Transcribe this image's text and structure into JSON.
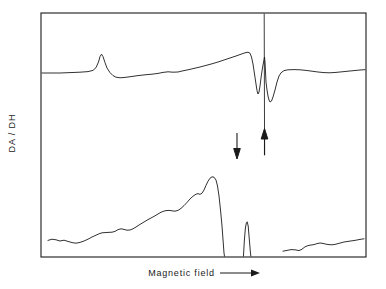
{
  "figure": {
    "type": "scientific-spectrum-figure",
    "background_color": "#ffffff",
    "line_color": "#1a1a1a",
    "frame": {
      "x": 41,
      "y": 13,
      "width": 325,
      "height": 244,
      "stroke_width": 1.1
    }
  },
  "labels": {
    "y_axis": "DA / DH",
    "x_axis": "Magnetic field",
    "x_axis_arrow_icon": "right-arrow-icon"
  },
  "chart_data": {
    "type": "line",
    "title": "",
    "xlabel": "Magnetic field",
    "ylabel": "DA / DH",
    "xlim": [
      41,
      366
    ],
    "ylim": [
      13,
      257
    ],
    "grid": false,
    "legend": null,
    "axis_ticks": "none",
    "series": [
      {
        "name": "upper-trace",
        "baseline_y": 73,
        "points": [
          [
            41,
            73
          ],
          [
            50,
            73
          ],
          [
            60,
            73
          ],
          [
            70,
            72.6
          ],
          [
            80,
            72.2
          ],
          [
            88,
            71.6
          ],
          [
            93,
            70.4
          ],
          [
            96,
            67.6
          ],
          [
            98.5,
            62.0
          ],
          [
            100,
            56.6
          ],
          [
            101.5,
            54.2
          ],
          [
            103,
            56.6
          ],
          [
            105,
            62.6
          ],
          [
            107,
            68.0
          ],
          [
            110,
            72.6
          ],
          [
            113,
            75.6
          ],
          [
            116,
            77.2
          ],
          [
            120,
            77.8
          ],
          [
            125,
            77.4
          ],
          [
            131,
            76.6
          ],
          [
            138,
            75.6
          ],
          [
            145,
            74.8
          ],
          [
            152,
            74.2
          ],
          [
            158,
            73.4
          ],
          [
            163,
            72.4
          ],
          [
            168,
            71.8
          ],
          [
            173,
            72.2
          ],
          [
            178,
            72.0
          ],
          [
            183,
            70.8
          ],
          [
            188,
            69.8
          ],
          [
            194,
            68.4
          ],
          [
            200,
            67.0
          ],
          [
            206,
            65.4
          ],
          [
            212,
            63.8
          ],
          [
            218,
            62.0
          ],
          [
            224,
            60.0
          ],
          [
            230,
            58.0
          ],
          [
            236,
            56.0
          ],
          [
            241,
            54.2
          ],
          [
            245,
            52.8
          ],
          [
            248,
            52.2
          ],
          [
            250,
            53.2
          ],
          [
            251.5,
            57.0
          ],
          [
            253,
            64.0
          ],
          [
            254.5,
            74.0
          ],
          [
            256,
            84.0
          ],
          [
            257,
            90.6
          ],
          [
            258,
            94.0
          ],
          [
            259,
            92.0
          ],
          [
            260,
            86.0
          ],
          [
            261,
            78.0
          ],
          [
            262,
            71.0
          ],
          [
            263,
            65.0
          ],
          [
            264,
            60.0
          ],
          [
            264.5,
            57.0
          ],
          [
            265,
            62.0
          ],
          [
            265.5,
            72.0
          ],
          [
            266,
            82.0
          ],
          [
            267,
            90.0
          ],
          [
            268,
            96.0
          ],
          [
            269,
            100.0
          ],
          [
            270,
            102.0
          ],
          [
            271.5,
            101.0
          ],
          [
            273,
            97.0
          ],
          [
            275,
            90.0
          ],
          [
            277,
            82.0
          ],
          [
            279,
            76.0
          ],
          [
            281,
            72.8
          ],
          [
            284,
            70.6
          ],
          [
            288,
            69.8
          ],
          [
            294,
            69.6
          ],
          [
            300,
            69.8
          ],
          [
            306,
            70.4
          ],
          [
            312,
            71.2
          ],
          [
            318,
            72.0
          ],
          [
            324,
            72.6
          ],
          [
            330,
            72.8
          ],
          [
            336,
            72.4
          ],
          [
            342,
            71.8
          ],
          [
            348,
            71.2
          ],
          [
            354,
            70.6
          ],
          [
            360,
            70.0
          ],
          [
            366,
            69.6
          ]
        ]
      },
      {
        "name": "upper-trace-sharp-line",
        "description": "near-vertical intense derivative line clipped at frame top",
        "points": [
          [
            264.2,
            13
          ],
          [
            264.6,
            155
          ]
        ]
      },
      {
        "name": "lower-trace-left",
        "baseline_y": 244,
        "points": [
          [
            48,
            240.4
          ],
          [
            52,
            239.2
          ],
          [
            56,
            239.8
          ],
          [
            60,
            241.0
          ],
          [
            64,
            240.2
          ],
          [
            68,
            241.4
          ],
          [
            72,
            242.6
          ],
          [
            76,
            243.2
          ],
          [
            80,
            242.4
          ],
          [
            84,
            241.0
          ],
          [
            88,
            239.2
          ],
          [
            92,
            237.0
          ],
          [
            96,
            235.2
          ],
          [
            99,
            233.8
          ],
          [
            102,
            232.8
          ],
          [
            105,
            232.6
          ],
          [
            108,
            232.4
          ],
          [
            112,
            232.2
          ],
          [
            115,
            231.4
          ],
          [
            118,
            229.6
          ],
          [
            121,
            228.8
          ],
          [
            124,
            229.4
          ],
          [
            127,
            230.2
          ],
          [
            130,
            230.0
          ],
          [
            133,
            228.8
          ],
          [
            136,
            227.0
          ],
          [
            139,
            225.0
          ],
          [
            142,
            223.2
          ],
          [
            145,
            221.4
          ],
          [
            148,
            219.6
          ],
          [
            151,
            218.0
          ],
          [
            154,
            216.4
          ],
          [
            157,
            214.6
          ],
          [
            160,
            212.8
          ],
          [
            163,
            211.4
          ],
          [
            166,
            210.6
          ],
          [
            169,
            210.4
          ],
          [
            172,
            210.8
          ],
          [
            175,
            211.2
          ],
          [
            178,
            210.4
          ],
          [
            181,
            208.4
          ],
          [
            184,
            205.6
          ],
          [
            187,
            202.4
          ],
          [
            190,
            199.0
          ],
          [
            193,
            196.2
          ],
          [
            196,
            194.2
          ],
          [
            198,
            193.6
          ],
          [
            200,
            194.4
          ],
          [
            202,
            193.2
          ],
          [
            204,
            190.0
          ],
          [
            206,
            185.4
          ],
          [
            208,
            181.2
          ],
          [
            210,
            178.2
          ],
          [
            212,
            176.8
          ],
          [
            214,
            177.2
          ],
          [
            216,
            180.0
          ],
          [
            217.5,
            186.0
          ],
          [
            219,
            196.0
          ],
          [
            220.5,
            210.0
          ],
          [
            222,
            226.0
          ],
          [
            223.2,
            242.0
          ],
          [
            224,
            253.0
          ],
          [
            224.6,
            257
          ]
        ]
      },
      {
        "name": "lower-trace-spike",
        "description": "narrow spike rising from baseline",
        "points": [
          [
            243.4,
            257
          ],
          [
            244.4,
            240.0
          ],
          [
            245.4,
            228.0
          ],
          [
            246.4,
            222.6
          ],
          [
            247.2,
            221.8
          ],
          [
            248.2,
            226.0
          ],
          [
            249.2,
            238.0
          ],
          [
            250.2,
            250.0
          ],
          [
            250.9,
            257
          ]
        ]
      },
      {
        "name": "lower-trace-right",
        "points": [
          [
            283,
            251.2
          ],
          [
            287,
            250.4
          ],
          [
            291,
            249.6
          ],
          [
            295,
            249.8
          ],
          [
            299,
            250.6
          ],
          [
            302,
            249.2
          ],
          [
            305,
            246.8
          ],
          [
            308,
            245.6
          ],
          [
            311,
            245.0
          ],
          [
            314,
            244.6
          ],
          [
            317,
            243.6
          ],
          [
            320,
            243.0
          ],
          [
            323,
            243.4
          ],
          [
            326,
            244.2
          ],
          [
            329,
            244.6
          ],
          [
            332,
            244.8
          ],
          [
            335,
            244.4
          ],
          [
            338,
            243.6
          ],
          [
            341,
            242.8
          ],
          [
            344,
            242.0
          ],
          [
            348,
            241.4
          ],
          [
            352,
            240.8
          ],
          [
            356,
            240.2
          ],
          [
            360,
            239.4
          ],
          [
            364,
            238.8
          ]
        ]
      }
    ],
    "annotations": [
      {
        "name": "arrow-marker-left",
        "icon": "down-arrow-icon",
        "direction": "down",
        "x": 237,
        "y_start": 133,
        "y_end": 158
      },
      {
        "name": "arrow-marker-right",
        "icon": "up-arrow-icon",
        "direction": "up",
        "x": 264.5,
        "y_start": 155,
        "y_end": 129
      }
    ]
  }
}
